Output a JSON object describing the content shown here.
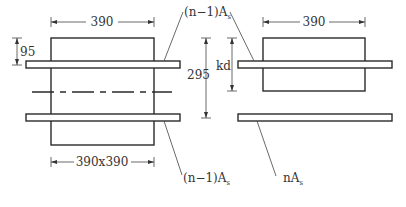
{
  "diagram": {
    "type": "transformed-section",
    "left_section": {
      "title": "gross transformed section",
      "width_dim": "390",
      "cover_dim": "95",
      "size_label": "390x390",
      "top_steel_label": {
        "main": "(n−1)A",
        "sub": "s"
      },
      "bottom_steel_label": {
        "main": "(n−1)A",
        "sub": "s"
      },
      "overall_depth_dim": "295"
    },
    "right_section": {
      "title": "cracked transformed section",
      "width_dim": "390",
      "neutral_axis_dim": "kd",
      "tension_steel_label": {
        "main": "nA",
        "sub": "s"
      }
    },
    "colors": {
      "line": "#2a2a2a",
      "text": "#333333",
      "background": "#ffffff"
    }
  }
}
